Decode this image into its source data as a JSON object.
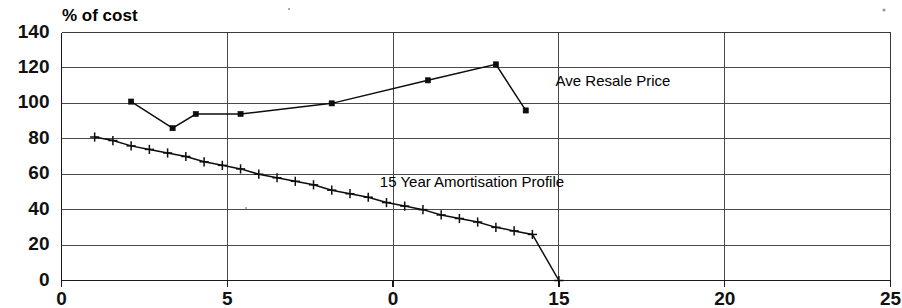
{
  "chart_data": {
    "type": "line",
    "title": "% of cost",
    "xlabel": "",
    "ylabel": "% of cost",
    "xlim": [
      0,
      25
    ],
    "ylim": [
      0,
      140
    ],
    "grid": true,
    "legend_position": "inline-annotation",
    "y_ticks": [
      0,
      20,
      40,
      60,
      80,
      100,
      120,
      140
    ],
    "y_tick_labels": [
      "0",
      "20",
      "40",
      "60",
      "80",
      "100",
      "120",
      "140"
    ],
    "x_ticks": [
      0,
      5,
      10,
      15,
      20,
      25
    ],
    "x_tick_labels": [
      "0",
      "5",
      "0",
      "15",
      "20",
      "25"
    ],
    "annotations": [
      {
        "text": "Ave Resale Price",
        "x": 14.9,
        "y": 110
      },
      {
        "text": "15 Year Amortisation Profile",
        "x": 9.6,
        "y": 53
      }
    ],
    "series": [
      {
        "name": "Ave Resale Price",
        "marker": "square",
        "x": [
          2.1,
          3.35,
          4.05,
          5.4,
          8.15,
          11.05,
          13.1,
          14.0
        ],
        "values": [
          101,
          86,
          94,
          94,
          100,
          113,
          122,
          96
        ]
      },
      {
        "name": "15 Year Amortisation Profile",
        "marker": "plus",
        "x": [
          1.0,
          1.55,
          2.1,
          2.65,
          3.2,
          3.75,
          4.3,
          4.85,
          5.4,
          5.95,
          6.5,
          7.05,
          7.6,
          8.15,
          8.7,
          9.25,
          9.8,
          10.35,
          10.9,
          11.45,
          12.0,
          12.55,
          13.1,
          13.65,
          14.2,
          15.0
        ],
        "values": [
          81,
          79,
          76,
          74,
          72,
          70,
          67,
          65,
          63,
          60,
          58,
          56,
          54,
          51,
          49,
          47,
          44,
          42,
          40,
          37,
          35,
          33,
          30,
          28,
          26,
          0
        ]
      }
    ]
  },
  "colors": {
    "series_line": "#0d0d0d",
    "grid": "#4a4a4a",
    "axis": "#1a1a1a",
    "background": "#ffffff",
    "text": "#000000"
  }
}
